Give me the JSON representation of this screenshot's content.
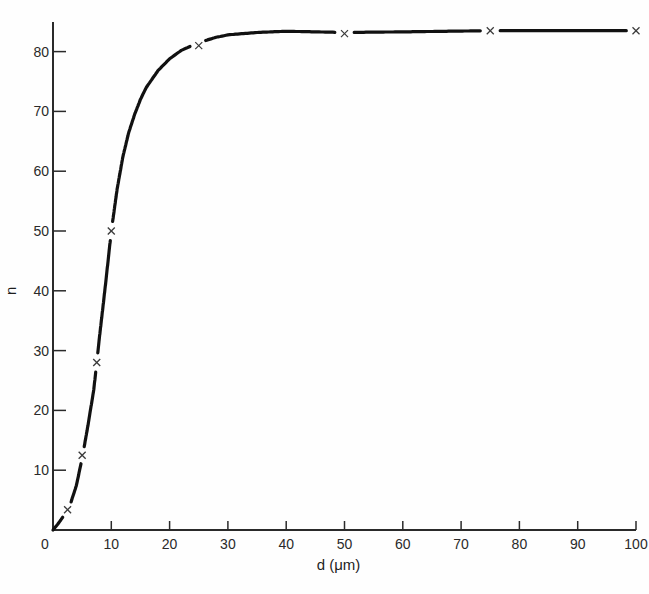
{
  "chart_data": {
    "type": "line",
    "title": "",
    "xlabel": "d (μm)",
    "ylabel": "n",
    "xlim": [
      0,
      100
    ],
    "ylim": [
      0,
      85
    ],
    "x_ticks": [
      0,
      10,
      20,
      30,
      40,
      50,
      60,
      70,
      80,
      90,
      100
    ],
    "x_tick_labels": [
      "0",
      "10",
      "20",
      "30",
      "40",
      "50",
      "60",
      "70",
      "80",
      "90",
      "100"
    ],
    "y_ticks": [
      10,
      20,
      30,
      40,
      50,
      60,
      70,
      80
    ],
    "y_tick_labels": [
      "10",
      "20",
      "30",
      "40",
      "50",
      "60",
      "70",
      "80"
    ],
    "grid": false,
    "legend": null,
    "marker": "x",
    "series": [
      {
        "name": "n vs d",
        "points": [
          {
            "x": 2.5,
            "y": 3.4
          },
          {
            "x": 5,
            "y": 12.5
          },
          {
            "x": 7.5,
            "y": 28
          },
          {
            "x": 10,
            "y": 50
          },
          {
            "x": 25,
            "y": 81
          },
          {
            "x": 50,
            "y": 83
          },
          {
            "x": 75,
            "y": 83.5
          },
          {
            "x": 100,
            "y": 83.5
          }
        ]
      }
    ],
    "fitted_curve": {
      "x": [
        0,
        1,
        2,
        2.5,
        3,
        4,
        5,
        6,
        7,
        7.5,
        8,
        9,
        10,
        11,
        12,
        13,
        14,
        15,
        16,
        18,
        20,
        22,
        25,
        28,
        30,
        35,
        40,
        45,
        50,
        60,
        75,
        90,
        100
      ],
      "y": [
        0,
        1.2,
        2.6,
        3.4,
        4.4,
        7.4,
        12,
        17.5,
        23.5,
        28,
        32.5,
        41,
        50,
        57,
        62.5,
        66.5,
        69.5,
        72,
        74,
        76.8,
        78.8,
        80.2,
        81.5,
        82.4,
        82.8,
        83.2,
        83.4,
        83.3,
        83.2,
        83.3,
        83.5,
        83.5,
        83.5
      ]
    }
  },
  "plot_area": {
    "origin_px": [
      53,
      530
    ],
    "x_px_per_unit": 5.83,
    "y_px_per_unit": 5.98,
    "y_axis_top_px": 22
  },
  "colors": {
    "ink": "#111111",
    "axis": "#2a2a2a",
    "marker": "#3a3a3a"
  }
}
